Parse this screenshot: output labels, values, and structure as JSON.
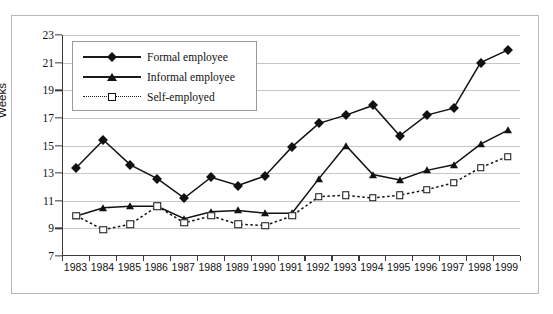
{
  "chart_data": {
    "type": "line",
    "title": "",
    "xlabel": "",
    "ylabel": "Weeks",
    "ylim": [
      7,
      23
    ],
    "ytick_step": 2,
    "yticks": [
      7,
      9,
      11,
      13,
      15,
      17,
      19,
      21,
      23
    ],
    "grid": true,
    "legend_position": "top-left-inside",
    "categories": [
      "1983",
      "1984",
      "1985",
      "1986",
      "1987",
      "1988",
      "1989",
      "1990",
      "1991",
      "1992",
      "1993",
      "1994",
      "1995",
      "1996",
      "1997",
      "1998",
      "1999"
    ],
    "series": [
      {
        "name": "Formal employee",
        "marker": "filled-diamond",
        "line": "solid",
        "color": "#111111",
        "values": [
          13.4,
          15.4,
          13.6,
          12.6,
          11.2,
          12.7,
          12.1,
          12.8,
          14.9,
          16.6,
          17.2,
          17.9,
          15.7,
          17.2,
          17.7,
          21.0,
          21.9
        ]
      },
      {
        "name": "Informal employee",
        "marker": "filled-triangle",
        "line": "solid",
        "color": "#111111",
        "values": [
          9.9,
          10.5,
          10.6,
          10.6,
          9.7,
          10.2,
          10.3,
          10.1,
          10.1,
          12.6,
          15.0,
          12.9,
          12.5,
          13.2,
          13.6,
          15.1,
          16.1
        ]
      },
      {
        "name": "Self-employed",
        "marker": "open-square",
        "line": "dotted",
        "color": "#111111",
        "values": [
          9.9,
          8.9,
          9.3,
          10.6,
          9.4,
          9.9,
          9.3,
          9.2,
          9.9,
          11.3,
          11.4,
          11.2,
          11.4,
          11.8,
          12.3,
          13.4,
          14.2
        ]
      }
    ]
  }
}
